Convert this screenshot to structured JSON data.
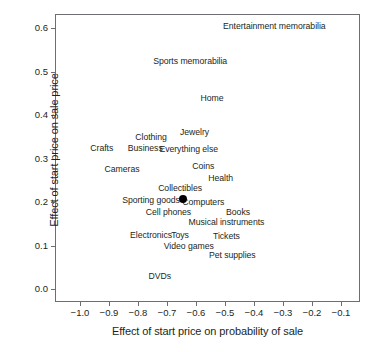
{
  "chart_data": {
    "type": "scatter",
    "title": "",
    "xlabel": "Effect of start price on probability of sale",
    "ylabel": "Effect of start price on sale price",
    "xlim": [
      -1.05,
      -0.05
    ],
    "ylim": [
      -0.015,
      0.625
    ],
    "grid": false,
    "legend": "none",
    "xticks": [
      "−1.0",
      "−0.9",
      "−0.8",
      "−0.7",
      "−0.6",
      "−0.5",
      "−0.4",
      "−0.3",
      "−0.2",
      "−0.1"
    ],
    "xtick_values": [
      -1.0,
      -0.9,
      -0.8,
      -0.7,
      -0.6,
      -0.5,
      -0.4,
      -0.3,
      -0.2,
      -0.1
    ],
    "yticks": [
      "0.0",
      "0.1",
      "0.2",
      "0.3",
      "0.4",
      "0.5",
      "0.6"
    ],
    "ytick_values": [
      0.0,
      0.1,
      0.2,
      0.3,
      0.4,
      0.5,
      0.6
    ],
    "marker_note": "single filled black dot plotted at the overall average",
    "points": [
      {
        "label": "Entertainment memorabilia",
        "x": -0.33,
        "y": 0.605,
        "marker": false
      },
      {
        "label": "Sports memorabilia",
        "x": -0.62,
        "y": 0.525,
        "marker": false
      },
      {
        "label": "Home",
        "x": -0.545,
        "y": 0.44,
        "marker": false
      },
      {
        "label": "Jewelry",
        "x": -0.605,
        "y": 0.36,
        "marker": false
      },
      {
        "label": "Clothing",
        "x": -0.755,
        "y": 0.35,
        "marker": false
      },
      {
        "label": "Crafts",
        "x": -0.925,
        "y": 0.325,
        "marker": false
      },
      {
        "label": "Business",
        "x": -0.775,
        "y": 0.325,
        "marker": false
      },
      {
        "label": "Everything else",
        "x": -0.625,
        "y": 0.322,
        "marker": false
      },
      {
        "label": "Cameras",
        "x": -0.855,
        "y": 0.275,
        "marker": false
      },
      {
        "label": "Coins",
        "x": -0.575,
        "y": 0.282,
        "marker": false
      },
      {
        "label": "Health",
        "x": -0.515,
        "y": 0.255,
        "marker": false
      },
      {
        "label": "Collectibles",
        "x": -0.655,
        "y": 0.232,
        "marker": false
      },
      {
        "label": "Sporting goods",
        "x": -0.755,
        "y": 0.205,
        "marker": false
      },
      {
        "label": "Computers",
        "x": -0.575,
        "y": 0.2,
        "marker": false
      },
      {
        "label": "Cell phones",
        "x": -0.695,
        "y": 0.178,
        "marker": false
      },
      {
        "label": "Books",
        "x": -0.455,
        "y": 0.178,
        "marker": false
      },
      {
        "label": "Musical instruments",
        "x": -0.495,
        "y": 0.155,
        "marker": false
      },
      {
        "label": "Electronics",
        "x": -0.755,
        "y": 0.125,
        "marker": false
      },
      {
        "label": "Toys",
        "x": -0.655,
        "y": 0.125,
        "marker": false
      },
      {
        "label": "Tickets",
        "x": -0.495,
        "y": 0.122,
        "marker": false
      },
      {
        "label": "Video games",
        "x": -0.625,
        "y": 0.1,
        "marker": false
      },
      {
        "label": "Pet supplies",
        "x": -0.475,
        "y": 0.078,
        "marker": false
      },
      {
        "label": "DVDs",
        "x": -0.725,
        "y": 0.03,
        "marker": false
      }
    ],
    "marker_point": {
      "x": -0.645,
      "y": 0.207
    }
  }
}
